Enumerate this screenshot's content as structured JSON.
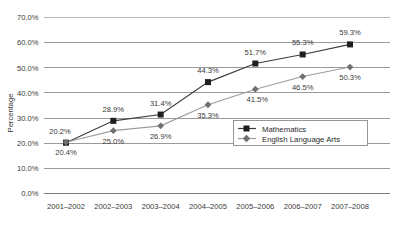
{
  "chart_data": {
    "type": "line",
    "title": "",
    "xlabel": "",
    "ylabel": "Percentage",
    "ylim": [
      0,
      70
    ],
    "ytick_step": 10,
    "grid": true,
    "legend_position": "inside-right",
    "categories": [
      "2001–2002",
      "2002–2003",
      "2003–2004",
      "2004–2005",
      "2005–2006",
      "2006–2007",
      "2007–2008"
    ],
    "ytick_labels": [
      "0.0%",
      "10.0%",
      "20.0%",
      "30.0%",
      "40.0%",
      "50.0%",
      "60.0%",
      "70.0%"
    ],
    "ytick_values": [
      0,
      10,
      20,
      30,
      40,
      50,
      60,
      70
    ],
    "series": [
      {
        "name": "Mathematics",
        "marker": "square",
        "color": "#3d3d3d",
        "values": [
          20.2,
          28.9,
          31.4,
          44.3,
          51.7,
          55.3,
          59.3
        ],
        "labels": [
          "20.2%",
          "28.9%",
          "31.4%",
          "44.3%",
          "51.7%",
          "55.3%",
          "59.3%"
        ]
      },
      {
        "name": "English Language Arts",
        "marker": "diamond",
        "color": "#9d9d9d",
        "values": [
          20.4,
          25.0,
          26.9,
          35.3,
          41.5,
          46.5,
          50.3
        ],
        "labels": [
          "20.4%",
          "25.0%",
          "26.9%",
          "35.3%",
          "41.5%",
          "46.5%",
          "50.3%"
        ]
      }
    ]
  },
  "legend": {
    "items": [
      {
        "label": "Mathematics"
      },
      {
        "label": "English Language Arts"
      }
    ]
  }
}
